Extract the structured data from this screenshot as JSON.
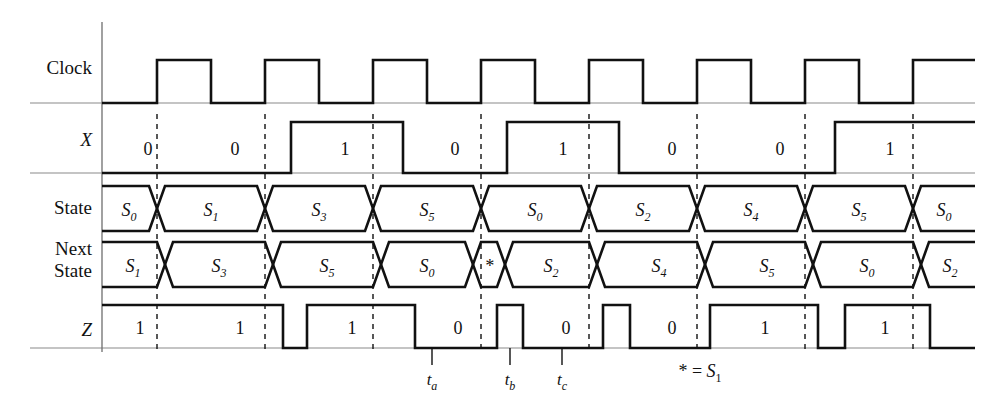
{
  "figure": {
    "type": "digital-timing-diagram",
    "title": "",
    "note": "* = S1",
    "note_parts": {
      "star": "*",
      "equals": "=",
      "state": "S",
      "sub": "1"
    }
  },
  "geometry": {
    "axis_x": 102,
    "right_x": 975,
    "clock_period": 108,
    "first_edge_x": 157,
    "edge_count": 8,
    "edges_x": [
      157,
      265,
      373,
      481,
      589,
      697,
      805,
      913
    ],
    "clock_high_width": 54
  },
  "rows": [
    {
      "name": "clock",
      "label": "Clock",
      "label_style": "roman",
      "label_y": 74,
      "top_y": 60,
      "base_y": 103
    },
    {
      "name": "x",
      "label": "X",
      "label_style": "italic",
      "label_y": 146,
      "top_y": 122,
      "base_y": 173
    },
    {
      "name": "state",
      "label": "State",
      "label_style": "roman",
      "label_y": 214,
      "top_y": 186,
      "base_y": 231
    },
    {
      "name": "next-state",
      "label": "Next State",
      "label_line1": "Next",
      "label_line2": "State",
      "label_style": "roman",
      "label_y1": 255,
      "label_y2": 277,
      "top_y": 242,
      "base_y": 287
    },
    {
      "name": "z",
      "label": "Z",
      "label_style": "italic",
      "label_y": 336,
      "top_y": 305,
      "base_y": 348
    }
  ],
  "chart_data": {
    "type": "line",
    "xlabel": "time",
    "ylabel": "signal",
    "signals": {
      "clock": {
        "label": "Clock",
        "kind": "binary",
        "description": "8 positive pulses, period 108px, high 54px, rising edges at each dashed marker",
        "pulses_x": [
          [
            157,
            211
          ],
          [
            265,
            319
          ],
          [
            373,
            427
          ],
          [
            481,
            535
          ],
          [
            589,
            643
          ],
          [
            697,
            751
          ],
          [
            805,
            859
          ],
          [
            913,
            975
          ]
        ]
      },
      "x": {
        "label": "X",
        "kind": "binary",
        "levels": [
          {
            "start": 102,
            "end": 291,
            "value": 0
          },
          {
            "start": 291,
            "end": 403,
            "value": 1
          },
          {
            "start": 403,
            "end": 507,
            "value": 0
          },
          {
            "start": 507,
            "end": 619,
            "value": 1
          },
          {
            "start": 619,
            "end": 835,
            "value": 0
          },
          {
            "start": 835,
            "end": 975,
            "value": 1
          }
        ],
        "value_labels": [
          {
            "text": "0",
            "x": 148
          },
          {
            "text": "0",
            "x": 235
          },
          {
            "text": "1",
            "x": 345
          },
          {
            "text": "0",
            "x": 455
          },
          {
            "text": "1",
            "x": 563
          },
          {
            "text": "0",
            "x": 672
          },
          {
            "text": "0",
            "x": 780
          },
          {
            "text": "1",
            "x": 890
          }
        ]
      },
      "state": {
        "label": "State",
        "kind": "bus",
        "transition_x": [
          157,
          265,
          373,
          481,
          589,
          697,
          805,
          913
        ],
        "values": [
          "S0",
          "S1",
          "S3",
          "S5",
          "S0",
          "S2",
          "S4",
          "S5",
          "S0"
        ],
        "value_base": [
          "S",
          "S",
          "S",
          "S",
          "S",
          "S",
          "S",
          "S",
          "S"
        ],
        "value_sub": [
          "0",
          "1",
          "3",
          "5",
          "0",
          "2",
          "4",
          "5",
          "0"
        ],
        "centers_x": [
          129,
          211,
          319,
          427,
          535,
          643,
          751,
          859,
          944
        ]
      },
      "next_state": {
        "label": "Next State",
        "kind": "bus",
        "transition_x": [
          165,
          273,
          381,
          473,
          505,
          597,
          705,
          813,
          921
        ],
        "values": [
          "S1",
          "S3",
          "S5",
          "S0",
          "*",
          "S2",
          "S4",
          "S5",
          "S0",
          "S2"
        ],
        "value_base": [
          "S",
          "S",
          "S",
          "S",
          "*",
          "S",
          "S",
          "S",
          "S",
          "S"
        ],
        "value_sub": [
          "1",
          "3",
          "5",
          "0",
          "",
          "2",
          "4",
          "5",
          "0",
          "2"
        ],
        "centers_x": [
          133,
          219,
          327,
          427,
          489,
          551,
          659,
          767,
          867,
          950
        ]
      },
      "z": {
        "label": "Z",
        "kind": "binary",
        "levels": [
          {
            "start": 102,
            "end": 283,
            "value": 1
          },
          {
            "start": 283,
            "end": 307,
            "value": 0
          },
          {
            "start": 307,
            "end": 415,
            "value": 1
          },
          {
            "start": 415,
            "end": 497,
            "value": 0
          },
          {
            "start": 497,
            "end": 523,
            "value": 1
          },
          {
            "start": 523,
            "end": 603,
            "value": 0
          },
          {
            "start": 603,
            "end": 630,
            "value": 1
          },
          {
            "start": 630,
            "end": 710,
            "value": 0
          },
          {
            "start": 710,
            "end": 818,
            "value": 1
          },
          {
            "start": 818,
            "end": 845,
            "value": 0
          },
          {
            "start": 845,
            "end": 930,
            "value": 1
          },
          {
            "start": 930,
            "end": 975,
            "value": 0
          }
        ],
        "value_labels": [
          {
            "text": "1",
            "x": 140
          },
          {
            "text": "1",
            "x": 240
          },
          {
            "text": "1",
            "x": 352
          },
          {
            "text": "0",
            "x": 458
          },
          {
            "text": "0",
            "x": 566
          },
          {
            "text": "0",
            "x": 672
          },
          {
            "text": "1",
            "x": 765
          },
          {
            "text": "1",
            "x": 885
          }
        ]
      }
    },
    "time_markers": [
      {
        "name": "ta",
        "base": "t",
        "sub": "a",
        "x": 432,
        "tick_y0": 348,
        "tick_y1": 365,
        "label_y": 385
      },
      {
        "name": "tb",
        "base": "t",
        "sub": "b",
        "x": 510,
        "tick_y0": 348,
        "tick_y1": 365,
        "label_y": 385
      },
      {
        "name": "tc",
        "base": "t",
        "sub": "c",
        "x": 562,
        "tick_y0": 348,
        "tick_y1": 365,
        "label_y": 385
      }
    ],
    "annotations": [
      {
        "name": "star-legend",
        "text": "* = S1",
        "x": 700,
        "y": 377
      }
    ],
    "grid": "vertical dashed lines at clock rising edges",
    "legend": "none"
  },
  "colors": {
    "wave": "#111111",
    "baseline": "#8a8a8a",
    "axis": "#6e6e6e",
    "dash": "#111111",
    "background": "#ffffff"
  }
}
